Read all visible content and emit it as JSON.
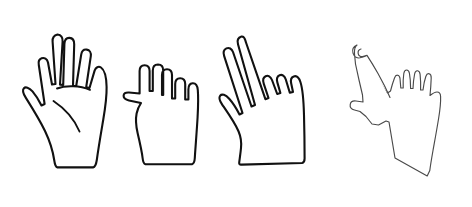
{
  "figure": {
    "background_color": "#ffffff",
    "panels": [
      {
        "id": "gesture-panel",
        "name": "hand-gesture-illustrations-panel",
        "label": "Hand gesture line drawings"
      },
      {
        "id": "skeleton-panel",
        "name": "hand-keypoint-skeleton-panel",
        "label": "Annotated hand with keypoint skeleton"
      }
    ],
    "rules": {
      "top_rule_y": 13,
      "bottom_rule_y": 190,
      "rule_x_start": 15,
      "rule_x_end": 460,
      "rule_color": "#6e6e6e",
      "divider_x": 329,
      "divider_color": "#3d3d3d"
    },
    "hands": [
      {
        "name": "open-palm-hand",
        "gesture": "open palm, five fingers spread",
        "extended_fingers": 5,
        "outline_color": "#111111",
        "fill_color": "#ffffff",
        "bbox": [
          25,
          33,
          110,
          168
        ]
      },
      {
        "name": "closed-fist-hand",
        "gesture": "closed fist, fingers curled, thumb out",
        "extended_fingers": 0,
        "outline_color": "#111111",
        "fill_color": "#ffffff",
        "bbox": [
          125,
          63,
          200,
          165
        ]
      },
      {
        "name": "peace-sign-hand",
        "gesture": "two fingers up, victory sign",
        "extended_fingers": 2,
        "outline_color": "#111111",
        "fill_color": "#ffffff",
        "bbox": [
          228,
          35,
          305,
          165
        ]
      },
      {
        "name": "annotated-skeleton-hand",
        "gesture": "pointing hand with keypoint skeleton overlay",
        "extended_fingers": 1,
        "outline_color": "#4a4a4a",
        "fill_color": "#ffffff",
        "bbox": [
          352,
          40,
          455,
          180
        ]
      }
    ],
    "skeleton": {
      "joint_count": 21,
      "joint_marker": "open-circle",
      "joint_fill": "#ffffff",
      "joint_stroke": "#2a2a2a",
      "wrist_marker": "filled-dot",
      "wrist_fill": "#151515",
      "bone_color": "#2a2a2a",
      "wrist": [
        396,
        119
      ],
      "chains": [
        {
          "name": "thumb-chain",
          "points": [
            [
              355,
              108
            ],
            [
              367,
              111
            ],
            [
              379,
              114
            ],
            [
              388,
              117
            ],
            [
              396,
              119
            ]
          ]
        },
        {
          "name": "index-finger-chain",
          "points": [
            [
              362,
              47
            ],
            [
              370,
              56
            ],
            [
              378,
              70
            ],
            [
              385,
              85
            ],
            [
              396,
              119
            ]
          ]
        },
        {
          "name": "middle-finger-chain",
          "points": [
            [
              398,
              62
            ],
            [
              400,
              72
            ],
            [
              401,
              82
            ],
            [
              400,
              92
            ],
            [
              396,
              119
            ]
          ]
        },
        {
          "name": "ring-finger-chain",
          "points": [
            [
              409,
              61
            ],
            [
              412,
              71
            ],
            [
              412,
              81
            ],
            [
              410,
              91
            ],
            [
              396,
              119
            ]
          ]
        },
        {
          "name": "little-finger-chain",
          "points": [
            [
              420,
              63
            ],
            [
              423,
              72
            ],
            [
              423,
              81
            ],
            [
              420,
              90
            ],
            [
              396,
              119
            ]
          ]
        },
        {
          "name": "pinky-chain",
          "points": [
            [
              430,
              68
            ],
            [
              432,
              77
            ],
            [
              430,
              85
            ],
            [
              425,
              93
            ],
            [
              396,
              119
            ]
          ]
        }
      ]
    }
  }
}
